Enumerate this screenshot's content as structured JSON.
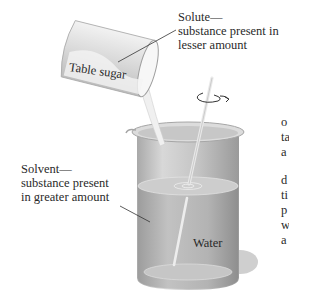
{
  "figure": {
    "solute_label": {
      "title": "Solute—",
      "line2": "substance present in",
      "line3": "lesser amount"
    },
    "solvent_label": {
      "title": "Solvent—",
      "line2": "substance present",
      "line3": "in greater amount"
    },
    "container_label": "Table sugar",
    "liquid_label": "Water",
    "icons": {
      "stir": "rotation-arrow-icon"
    }
  },
  "truncated_body_text": {
    "lines": [
      "o",
      "ta",
      "a",
      "d",
      "ti",
      "p",
      "w",
      "a"
    ]
  },
  "colors": {
    "glass": "#c9c9c9",
    "water": "#b5b5b5",
    "sugar": "#eeeeee",
    "text": "#2a2a2a"
  }
}
